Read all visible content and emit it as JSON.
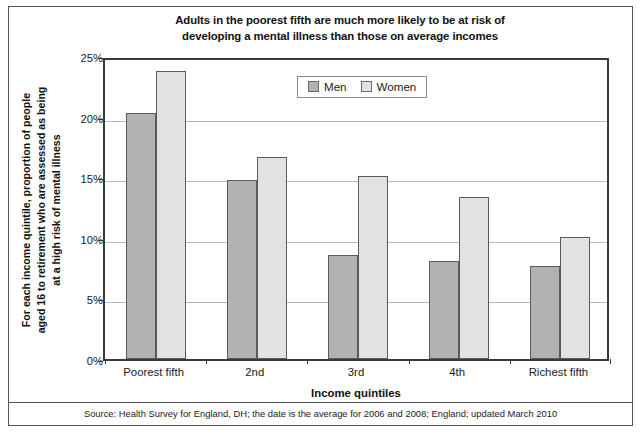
{
  "chart_data": {
    "type": "bar",
    "title": "Adults in the poorest fifth are much more likely to be at risk of developing a mental illness than those on average incomes",
    "title_lines": [
      "Adults in the poorest fifth are much more likely to be at risk of",
      "developing a mental illness than those on average incomes"
    ],
    "xlabel": "Income quintiles",
    "ylabel": "For each income quintile, proportion of people aged 16 to retirement who are assessed as being at a high risk of mental illness",
    "ylabel_lines": [
      "For each income quintile, proportion of people",
      "aged 16 to retirement who are assessed as being",
      "at a high risk of mental illness"
    ],
    "categories": [
      "Poorest fifth",
      "2nd",
      "3rd",
      "4th",
      "Richest fifth"
    ],
    "series": [
      {
        "name": "Men",
        "color": "#b2b2b2",
        "values": [
          20.3,
          14.8,
          8.6,
          8.1,
          7.7
        ]
      },
      {
        "name": "Women",
        "color": "#e2e2e2",
        "values": [
          23.8,
          16.7,
          15.1,
          13.4,
          10.1
        ]
      }
    ],
    "ylim": [
      0,
      25
    ],
    "ytick_values": [
      0,
      5,
      10,
      15,
      20,
      25
    ],
    "ytick_labels": [
      "0%",
      "5%",
      "10%",
      "15%",
      "20%",
      "25%"
    ],
    "grid": true,
    "legend_position": "top-center",
    "units": "percent"
  },
  "source": {
    "note": "Source: Health Survey for England, DH; the date is the average for 2006 and 2008; England; updated March 2010"
  },
  "colors": {
    "men_fill": "#b2b2b2",
    "women_fill": "#e2e2e2",
    "bar_edge": "#5a5a5a",
    "axis": "#3a3a3a",
    "gridline": "#b9b9b9",
    "frame": "#555555",
    "background": "#ffffff"
  }
}
